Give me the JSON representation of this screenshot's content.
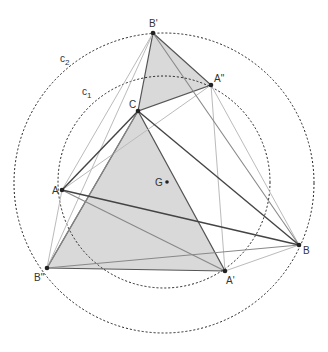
{
  "figure": {
    "title": "",
    "circles": [
      {
        "name": "c2",
        "label": "c",
        "sub": "2",
        "cx": 164,
        "cy": 183,
        "r": 150,
        "style": "dashed"
      },
      {
        "name": "c1",
        "label": "c",
        "sub": "1",
        "cx": 164,
        "cy": 182,
        "r": 106,
        "style": "dashed"
      }
    ],
    "points": {
      "Bp": {
        "label": "B'",
        "x": 153,
        "y": 33
      },
      "App": {
        "label": "A\"",
        "x": 211,
        "y": 85
      },
      "C": {
        "label": "C",
        "x": 138,
        "y": 111
      },
      "G": {
        "label": "G",
        "x": 167,
        "y": 182
      },
      "A": {
        "label": "A",
        "x": 62,
        "y": 190
      },
      "Bpp": {
        "label": "B\"",
        "x": 47,
        "y": 268
      },
      "Ap": {
        "label": "A'",
        "x": 225,
        "y": 271
      },
      "B": {
        "label": "B",
        "x": 299,
        "y": 245
      }
    },
    "colors": {
      "fill": "#d9d9d9",
      "dark_line": "#444444",
      "mid_line": "#888888",
      "light_line": "#bbbbbb",
      "point": "#222222"
    }
  }
}
